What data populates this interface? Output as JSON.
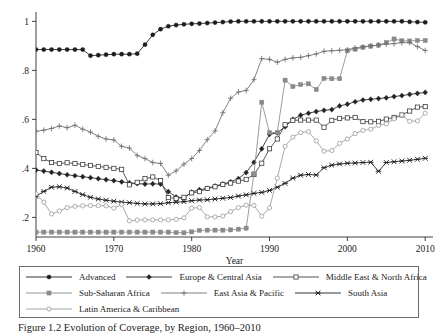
{
  "figure": {
    "caption": "Figure 1.2  Evolution of Coverage, by Region, 1960–2010"
  },
  "chart_data": {
    "type": "line",
    "title": "",
    "xlabel": "Year",
    "ylabel": "",
    "xlim": [
      1960,
      2011
    ],
    "ylim": [
      0.12,
      1.03
    ],
    "xticks": [
      1960,
      1970,
      1980,
      1990,
      2000,
      2010
    ],
    "xticklabels": [
      "1960",
      "1970",
      "1980",
      "1990",
      "2000",
      "2010"
    ],
    "yticks": [
      0.2,
      0.4,
      0.6,
      0.8,
      1.0
    ],
    "yticklabels": [
      ".2",
      ".4",
      ".6",
      ".8",
      "1"
    ],
    "grid": false,
    "legend_position": "below-plot",
    "x": [
      1960,
      1961,
      1962,
      1963,
      1964,
      1965,
      1966,
      1967,
      1968,
      1969,
      1970,
      1971,
      1972,
      1973,
      1974,
      1975,
      1976,
      1977,
      1978,
      1979,
      1980,
      1981,
      1982,
      1983,
      1984,
      1985,
      1986,
      1987,
      1988,
      1989,
      1990,
      1991,
      1992,
      1993,
      1994,
      1995,
      1996,
      1997,
      1998,
      1999,
      2000,
      2001,
      2002,
      2003,
      2004,
      2005,
      2006,
      2007,
      2008,
      2009,
      2010
    ],
    "series": [
      {
        "name": "Advanced",
        "marker": "filled-circle",
        "color": "#1d1d1d",
        "values": [
          0.885,
          0.885,
          0.885,
          0.885,
          0.885,
          0.885,
          0.885,
          0.86,
          0.862,
          0.864,
          0.866,
          0.866,
          0.866,
          0.868,
          0.905,
          0.945,
          0.968,
          0.98,
          0.985,
          0.988,
          0.99,
          0.991,
          0.993,
          0.995,
          0.997,
          0.999,
          1.0,
          1.0,
          1.0,
          1.0,
          1.0,
          1.0,
          1.0,
          1.0,
          1.0,
          1.0,
          1.0,
          1.0,
          1.0,
          1.0,
          1.0,
          1.0,
          1.0,
          1.0,
          1.0,
          1.0,
          1.0,
          1.0,
          0.998,
          0.997,
          0.996
        ]
      },
      {
        "name": "Europe & Central Asia",
        "marker": "filled-diamond",
        "color": "#242424",
        "values": [
          0.393,
          0.389,
          0.384,
          0.379,
          0.374,
          0.37,
          0.366,
          0.362,
          0.358,
          0.354,
          0.35,
          0.345,
          0.341,
          0.338,
          0.336,
          0.337,
          0.336,
          0.305,
          0.283,
          0.279,
          0.303,
          0.313,
          0.318,
          0.328,
          0.336,
          0.345,
          0.358,
          0.383,
          0.425,
          0.48,
          0.539,
          0.545,
          0.57,
          0.6,
          0.617,
          0.625,
          0.632,
          0.637,
          0.64,
          0.655,
          0.662,
          0.672,
          0.679,
          0.682,
          0.685,
          0.688,
          0.693,
          0.697,
          0.702,
          0.706,
          0.71
        ]
      },
      {
        "name": "Middle East & North Africa",
        "marker": "open-square",
        "color": "#3c3c3c",
        "values": [
          0.465,
          0.44,
          0.424,
          0.42,
          0.423,
          0.42,
          0.416,
          0.412,
          0.408,
          0.404,
          0.4,
          0.396,
          0.333,
          0.343,
          0.358,
          0.365,
          0.35,
          0.281,
          0.277,
          0.282,
          0.3,
          0.305,
          0.318,
          0.325,
          0.334,
          0.34,
          0.348,
          0.355,
          0.375,
          0.421,
          0.48,
          0.52,
          0.578,
          0.596,
          0.597,
          0.597,
          0.597,
          0.568,
          0.596,
          0.604,
          0.606,
          0.608,
          0.591,
          0.59,
          0.592,
          0.601,
          0.608,
          0.618,
          0.634,
          0.65,
          0.652
        ]
      },
      {
        "name": "Sub-Saharan Africa",
        "marker": "filled-square",
        "color": "#8a8a8a",
        "values": [
          0.14,
          0.14,
          0.14,
          0.14,
          0.14,
          0.14,
          0.14,
          0.14,
          0.14,
          0.14,
          0.14,
          0.14,
          0.14,
          0.14,
          0.14,
          0.14,
          0.14,
          0.14,
          0.138,
          0.137,
          0.141,
          0.147,
          0.148,
          0.148,
          0.148,
          0.149,
          0.152,
          0.156,
          0.378,
          0.67,
          0.546,
          0.547,
          0.76,
          0.734,
          0.742,
          0.745,
          0.722,
          0.767,
          0.766,
          0.766,
          0.88,
          0.886,
          0.894,
          0.899,
          0.903,
          0.914,
          0.928,
          0.921,
          0.92,
          0.922,
          0.922
        ]
      },
      {
        "name": "East Asia & Pacific",
        "marker": "plus",
        "color": "#6f6f6f",
        "values": [
          0.551,
          0.556,
          0.563,
          0.573,
          0.566,
          0.576,
          0.56,
          0.548,
          0.531,
          0.52,
          0.516,
          0.49,
          0.483,
          0.453,
          0.44,
          0.424,
          0.42,
          0.372,
          0.39,
          0.417,
          0.44,
          0.473,
          0.517,
          0.553,
          0.627,
          0.686,
          0.712,
          0.718,
          0.762,
          0.848,
          0.845,
          0.833,
          0.845,
          0.851,
          0.853,
          0.86,
          0.867,
          0.878,
          0.88,
          0.882,
          0.884,
          0.892,
          0.896,
          0.9,
          0.903,
          0.907,
          0.909,
          0.913,
          0.913,
          0.897,
          0.881
        ]
      },
      {
        "name": "South Asia",
        "marker": "star-x",
        "color": "#1d1d1d",
        "values": [
          0.286,
          0.306,
          0.323,
          0.325,
          0.32,
          0.306,
          0.293,
          0.282,
          0.275,
          0.27,
          0.266,
          0.262,
          0.26,
          0.257,
          0.255,
          0.255,
          0.256,
          0.26,
          0.262,
          0.264,
          0.268,
          0.271,
          0.272,
          0.275,
          0.278,
          0.281,
          0.287,
          0.292,
          0.298,
          0.302,
          0.31,
          0.323,
          0.339,
          0.36,
          0.372,
          0.375,
          0.373,
          0.403,
          0.413,
          0.418,
          0.421,
          0.422,
          0.424,
          0.425,
          0.388,
          0.424,
          0.427,
          0.43,
          0.433,
          0.437,
          0.441
        ]
      },
      {
        "name": "Latin America & Caribbean",
        "marker": "open-circle",
        "color": "#9a9a9a",
        "values": [
          0.297,
          0.262,
          0.214,
          0.226,
          0.24,
          0.245,
          0.247,
          0.248,
          0.248,
          0.247,
          0.238,
          0.252,
          0.186,
          0.189,
          0.19,
          0.19,
          0.19,
          0.19,
          0.192,
          0.198,
          0.238,
          0.24,
          0.202,
          0.202,
          0.205,
          0.224,
          0.24,
          0.25,
          0.249,
          0.205,
          0.239,
          0.36,
          0.49,
          0.528,
          0.546,
          0.55,
          0.512,
          0.47,
          0.473,
          0.502,
          0.52,
          0.542,
          0.555,
          0.56,
          0.575,
          0.582,
          0.602,
          0.618,
          0.592,
          0.594,
          0.625
        ]
      }
    ]
  },
  "legend": {
    "rows": [
      [
        {
          "label": "Advanced",
          "marker": "filled-circle"
        },
        {
          "label": "Europe & Central Asia",
          "marker": "filled-diamond"
        },
        {
          "label": "Middle East & North Africa",
          "marker": "open-square"
        }
      ],
      [
        {
          "label": "Sub-Saharan Africa",
          "marker": "filled-square"
        },
        {
          "label": "East Asia & Pacific",
          "marker": "plus"
        },
        {
          "label": "South Asia",
          "marker": "star-x"
        }
      ],
      [
        {
          "label": "Latin America & Caribbean",
          "marker": "open-circle"
        }
      ]
    ]
  }
}
